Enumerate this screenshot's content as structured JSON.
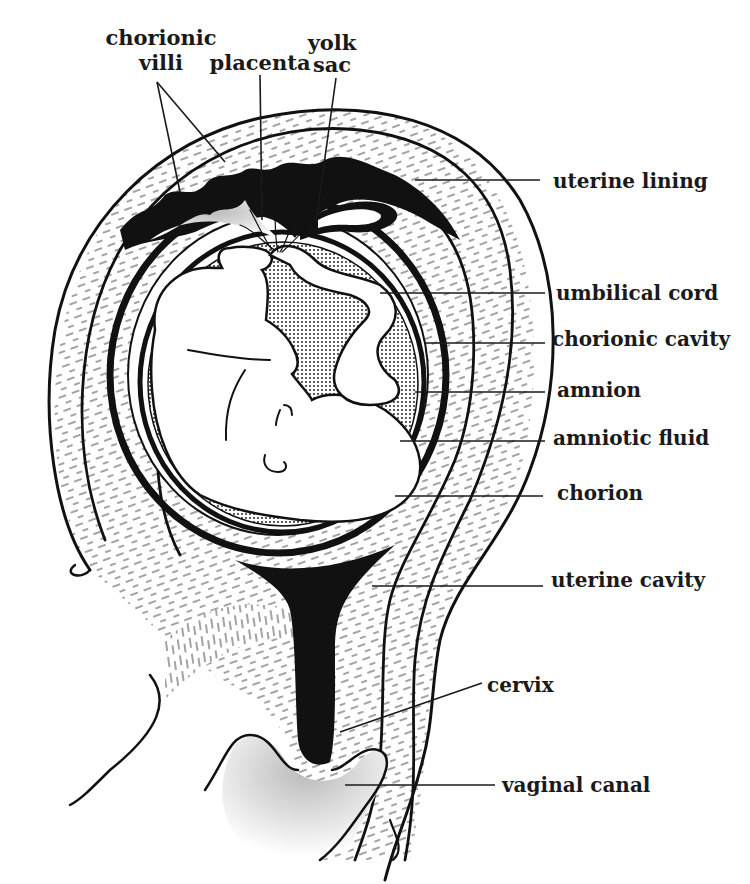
{
  "diagram": {
    "ink_color": "#111111",
    "background": "#ffffff",
    "top_labels": [
      {
        "id": "chorionic-villi",
        "lines": [
          "chorionic",
          "villi"
        ],
        "x": 161,
        "y": [
          45,
          70
        ]
      },
      {
        "id": "placenta",
        "lines": [
          "placenta"
        ],
        "x": 260,
        "y": [
          70
        ]
      },
      {
        "id": "yolk-sac",
        "lines": [
          "yolk",
          "sac"
        ],
        "x": 332,
        "y": [
          50,
          72
        ]
      }
    ],
    "right_labels": [
      {
        "id": "uterine-lining",
        "text": "uterine lining",
        "x": 553,
        "y": 188
      },
      {
        "id": "umbilical-cord",
        "text": "umbilical cord",
        "x": 556,
        "y": 300
      },
      {
        "id": "chorionic-cavity",
        "text": "chorionic cavity",
        "x": 552,
        "y": 346
      },
      {
        "id": "amnion",
        "text": "amnion",
        "x": 557,
        "y": 397
      },
      {
        "id": "amniotic-fluid",
        "text": "amniotic fluid",
        "x": 553,
        "y": 445
      },
      {
        "id": "chorion",
        "text": "chorion",
        "x": 557,
        "y": 500
      },
      {
        "id": "uterine-cavity",
        "text": "uterine cavity",
        "x": 551,
        "y": 587
      },
      {
        "id": "cervix",
        "text": "cervix",
        "x": 487,
        "y": 692
      },
      {
        "id": "vaginal-canal",
        "text": "vaginal canal",
        "x": 502,
        "y": 792
      }
    ]
  }
}
